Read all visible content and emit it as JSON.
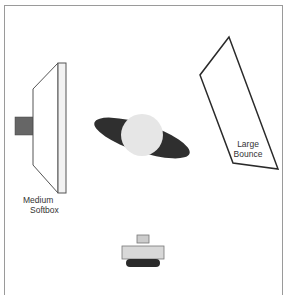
{
  "diagram": {
    "type": "lighting-setup-top-view",
    "colors": {
      "frame": "#9a9a9a",
      "outline": "#2a2a2a",
      "softbox_face": "#f2f2f2",
      "light_head": "#666666",
      "subject_head": "#e6e6e6",
      "subject_shoulders": "#2f2f2f",
      "camera_body": "#d8d8d8",
      "camera_base": "#2a2a2a"
    },
    "elements": [
      {
        "id": "medium-softbox",
        "label_line1": "Medium",
        "label_line2": "Softbox"
      },
      {
        "id": "large-bounce",
        "label_line1": "Large",
        "label_line2": "Bounce"
      },
      {
        "id": "subject",
        "label": ""
      },
      {
        "id": "camera",
        "label": ""
      }
    ]
  }
}
